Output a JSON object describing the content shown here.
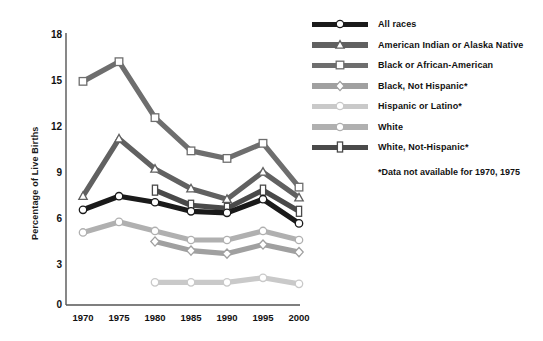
{
  "chart_data": {
    "type": "line",
    "title": "",
    "xlabel": "",
    "ylabel": "Percentage of Live Births",
    "x": [
      1970,
      1975,
      1980,
      1985,
      1990,
      1995,
      2000
    ],
    "categories": [
      "1970",
      "1975",
      "1980",
      "1985",
      "1990",
      "1995",
      "2000"
    ],
    "xticklabels": [
      "1970",
      "1975",
      "1980",
      "1985",
      "1990",
      "1995",
      "2000"
    ],
    "yticklabels": [
      "0",
      "3",
      "6",
      "9",
      "12",
      "15",
      "18"
    ],
    "yticks": [
      0,
      3,
      6,
      9,
      12,
      15,
      18
    ],
    "ylim": [
      0,
      18
    ],
    "grid": false,
    "legend_position": "right",
    "footnote": "*Data not available for 1970, 1975",
    "series": [
      {
        "name": "All races",
        "marker": "circle",
        "color": "#1a1a1a",
        "values": [
          6.3,
          7.2,
          6.8,
          6.2,
          6.1,
          7.0,
          5.4
        ]
      },
      {
        "name": "American Indian or Alaska Native",
        "marker": "triangle",
        "color": "#616161",
        "values": [
          7.2,
          11.0,
          9.0,
          7.7,
          7.0,
          8.8,
          7.1
        ]
      },
      {
        "name": "Black or African-American",
        "marker": "square",
        "color": "#6e6e6e",
        "values": [
          14.8,
          16.1,
          12.4,
          10.2,
          9.7,
          10.7,
          7.8
        ]
      },
      {
        "name": "Black, Not Hispanic*",
        "marker": "diamond",
        "color": "#a0a0a0",
        "values": [
          null,
          null,
          4.2,
          3.6,
          3.4,
          4.0,
          3.5
        ]
      },
      {
        "name": "Hispanic or Latino*",
        "marker": "circle",
        "color": "#c9c9c9",
        "values": [
          null,
          null,
          1.5,
          1.5,
          1.5,
          1.8,
          1.4
        ]
      },
      {
        "name": "White",
        "marker": "circle",
        "color": "#b0b0b0",
        "values": [
          4.8,
          5.5,
          4.9,
          4.3,
          4.3,
          4.9,
          4.3
        ]
      },
      {
        "name": "White, Not-Hispanic*",
        "marker": "square-tall",
        "color": "#4a4a4a",
        "values": [
          null,
          null,
          7.6,
          6.6,
          6.4,
          7.6,
          6.2
        ]
      }
    ]
  },
  "legend": {
    "items": [
      {
        "label": "All races"
      },
      {
        "label": "American Indian or Alaska Native"
      },
      {
        "label": "Black or African-American"
      },
      {
        "label": "Black, Not Hispanic*"
      },
      {
        "label": "Hispanic or Latino*"
      },
      {
        "label": "White"
      },
      {
        "label": "White, Not-Hispanic*"
      }
    ],
    "note": "*Data not available for 1970, 1975"
  },
  "axes": {
    "ylabel": "Percentage of Live Births"
  }
}
